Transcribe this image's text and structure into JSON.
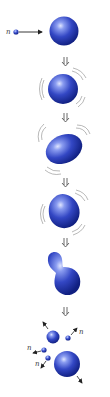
{
  "diagram": {
    "labels": {
      "incoming_neutron": "n",
      "neutron_1": "n",
      "neutron_2": "n",
      "neutron_3": "n"
    },
    "stages": [
      {
        "name": "neutron-approach",
        "description": "Neutron approaching nucleus"
      },
      {
        "name": "vibrating-nucleus",
        "description": "Nucleus absorbs neutron and vibrates"
      },
      {
        "name": "elongated-nucleus",
        "description": "Nucleus elongates"
      },
      {
        "name": "deformed-nucleus",
        "description": "Nucleus deforms"
      },
      {
        "name": "necking-nucleus",
        "description": "Nucleus forms a neck"
      },
      {
        "name": "fission-products",
        "description": "Nucleus splits into two fragments and releases neutrons"
      }
    ],
    "colors": {
      "nucleus": "#2a3fb0",
      "highlight": "#cfd8ff",
      "shadow": "#0d1a6b",
      "arrow": "#333333",
      "vibration": "#888888"
    }
  }
}
